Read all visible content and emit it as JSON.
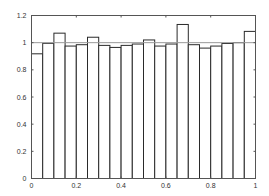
{
  "chart_data": {
    "type": "bar",
    "subtype": "histogram",
    "title": "",
    "xlabel": "",
    "ylabel": "",
    "xlim": [
      0,
      1
    ],
    "ylim": [
      0,
      1.2
    ],
    "bin_width": 0.05,
    "bin_edges": [
      0,
      0.05,
      0.1,
      0.15,
      0.2,
      0.25,
      0.3,
      0.35,
      0.4,
      0.45,
      0.5,
      0.55,
      0.6,
      0.65,
      0.7,
      0.75,
      0.8,
      0.85,
      0.9,
      0.95,
      1.0
    ],
    "values": [
      0.918,
      0.995,
      1.07,
      0.975,
      0.985,
      1.04,
      0.98,
      0.965,
      0.98,
      0.99,
      1.02,
      0.975,
      0.99,
      1.134,
      0.985,
      0.96,
      0.975,
      0.994,
      1.0,
      1.083
    ],
    "reference_line": {
      "y": 1.0,
      "color": "#9a9a9a"
    },
    "xticks": [
      0,
      0.2,
      0.4,
      0.6,
      0.8,
      1
    ],
    "xtick_labels": [
      "0",
      "0.2",
      "0.4",
      "0.6",
      "0.8",
      "1"
    ],
    "yticks": [
      0,
      0.2,
      0.4,
      0.6,
      0.8,
      1,
      1.2
    ],
    "ytick_labels": [
      "0",
      "0.2",
      "0.4",
      "0.6",
      "0.8",
      "1",
      "1.2"
    ],
    "grid": false,
    "legend": null,
    "bar_fill": "#ffffff",
    "bar_edge": "#2a2a2a"
  }
}
